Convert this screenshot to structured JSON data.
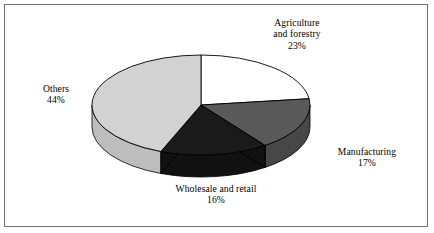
{
  "chart_data": {
    "type": "pie",
    "title": "",
    "subtitle": "",
    "xlabel": "",
    "ylabel": "",
    "legend_position": "none",
    "grid": false,
    "three_d": true,
    "start_angle_deg": 0,
    "direction": "clockwise",
    "categories": [
      "Agriculture and forestry",
      "Manufacturing",
      "Wholesale and retail",
      "Others"
    ],
    "values": [
      23,
      17,
      16,
      44
    ],
    "units": "%",
    "slices": [
      {
        "name": "agriculture-and-forestry",
        "label_line1": "Agriculture",
        "label_line2": "and forestry",
        "value": 23,
        "value_text": "23%",
        "color": "#ffffff",
        "side_color": "#e3e3e3",
        "start_pct": 0,
        "end_pct": 23
      },
      {
        "name": "manufacturing",
        "label_line1": "Manufacturing",
        "label_line2": "",
        "value": 17,
        "value_text": "17%",
        "color": "#595959",
        "side_color": "#474747",
        "start_pct": 23,
        "end_pct": 40
      },
      {
        "name": "wholesale-and-retail",
        "label_line1": "Wholesale and retail",
        "label_line2": "",
        "value": 16,
        "value_text": "16%",
        "color": "#1a1a1a",
        "side_color": "#111111",
        "start_pct": 40,
        "end_pct": 56
      },
      {
        "name": "others",
        "label_line1": "Others",
        "label_line2": "",
        "value": 44,
        "value_text": "44%",
        "color": "#d2d2d2",
        "side_color": "#bdbdbd",
        "start_pct": 56,
        "end_pct": 100
      }
    ],
    "colors": {
      "outline": "#000000",
      "frame": "#6e6e6e",
      "background": "#ffffff",
      "text": "#000000"
    }
  }
}
